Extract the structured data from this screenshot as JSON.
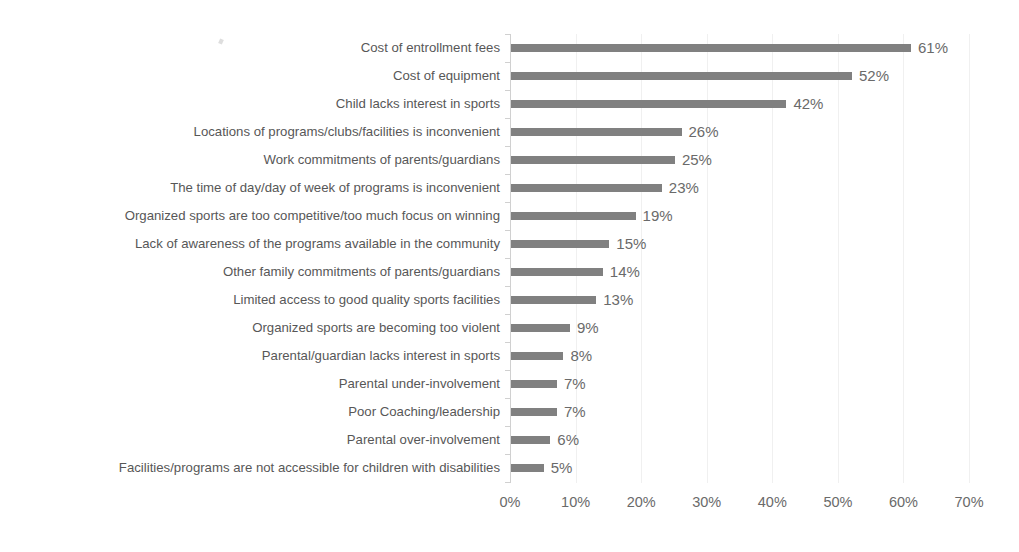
{
  "chart_data": {
    "type": "bar",
    "orientation": "horizontal",
    "title": "",
    "subtitle": "",
    "xlabel": "",
    "ylabel": "",
    "xlim": [
      0,
      70
    ],
    "grid": true,
    "legend": false,
    "bar_color": "#808080",
    "label_color": "#575757",
    "value_color": "#6a6a6a",
    "axis_color": "#d0d0d0",
    "gridline_color": "#f0f0f0",
    "background": "#ffffff",
    "xticks": [
      0,
      10,
      20,
      30,
      40,
      50,
      60,
      70
    ],
    "xtick_labels": [
      "0%",
      "10%",
      "20%",
      "30%",
      "40%",
      "50%",
      "60%",
      "70%"
    ],
    "categories": [
      "Cost of entrollment fees",
      "Cost of equipment",
      "Child lacks interest in sports",
      "Locations of programs/clubs/facilities is inconvenient",
      "Work commitments of parents/guardians",
      "The time of day/day of week of programs is inconvenient",
      "Organized sports are too competitive/too much focus on winning",
      "Lack of awareness of the programs available in the community",
      "Other family commitments of parents/guardians",
      "Limited access to good quality sports facilities",
      "Organized sports are becoming too violent",
      "Parental/guardian lacks interest in sports",
      "Parental under-involvement",
      "Poor Coaching/leadership",
      "Parental over-involvement",
      "Facilities/programs are not accessible for children with disabilities"
    ],
    "values": [
      61,
      52,
      42,
      26,
      25,
      23,
      19,
      15,
      14,
      13,
      9,
      8,
      7,
      7,
      6,
      5
    ],
    "value_labels": [
      "61%",
      "52%",
      "42%",
      "26%",
      "25%",
      "23%",
      "19%",
      "15%",
      "14%",
      "13%",
      "9%",
      "8%",
      "7%",
      "7%",
      "6%",
      "5%"
    ]
  }
}
